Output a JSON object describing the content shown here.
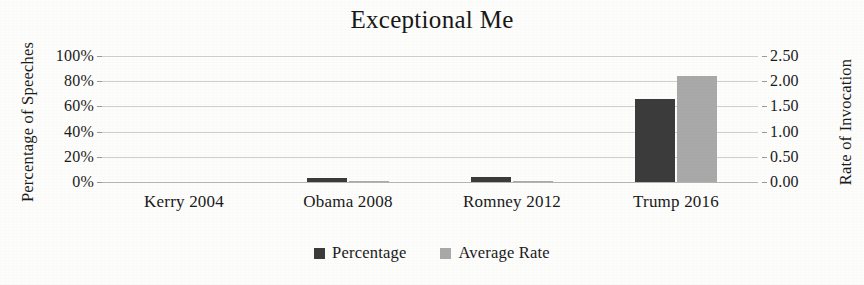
{
  "chart_data": {
    "type": "bar",
    "title": "Exceptional Me",
    "categories": [
      "Kerry 2004",
      "Obama 2008",
      "Romney 2012",
      "Trump 2016"
    ],
    "series": [
      {
        "name": "Percentage",
        "axis": "left",
        "color": "#3b3b3b",
        "values": [
          0,
          3,
          4,
          66
        ]
      },
      {
        "name": "Average Rate",
        "axis": "right",
        "color": "#a9a9a9",
        "values": [
          0.0,
          0.02,
          0.03,
          2.1
        ]
      }
    ],
    "xlabel": "",
    "ylabel": "Percentage of Speeches",
    "y2label": "Rate of Invocation",
    "ylim": [
      0,
      100
    ],
    "y2lim": [
      0,
      2.5
    ],
    "yticks": [
      "0%",
      "20%",
      "40%",
      "60%",
      "80%",
      "100%"
    ],
    "ytick_values": [
      0,
      20,
      40,
      60,
      80,
      100
    ],
    "y2ticks": [
      "0.00",
      "0.50",
      "1.00",
      "1.50",
      "2.00",
      "2.50"
    ],
    "y2tick_values": [
      0.0,
      0.5,
      1.0,
      1.5,
      2.0,
      2.5
    ],
    "grid": true,
    "legend_position": "bottom",
    "legend": [
      "Percentage",
      "Average Rate"
    ]
  },
  "axes": {
    "left_title": "Percentage of Speeches",
    "right_title": "Rate of Invocation"
  },
  "legend": {
    "items": [
      {
        "label": "Percentage",
        "swatch": "percentage-swatch"
      },
      {
        "label": "Average Rate",
        "swatch": "average-rate-swatch"
      }
    ]
  }
}
